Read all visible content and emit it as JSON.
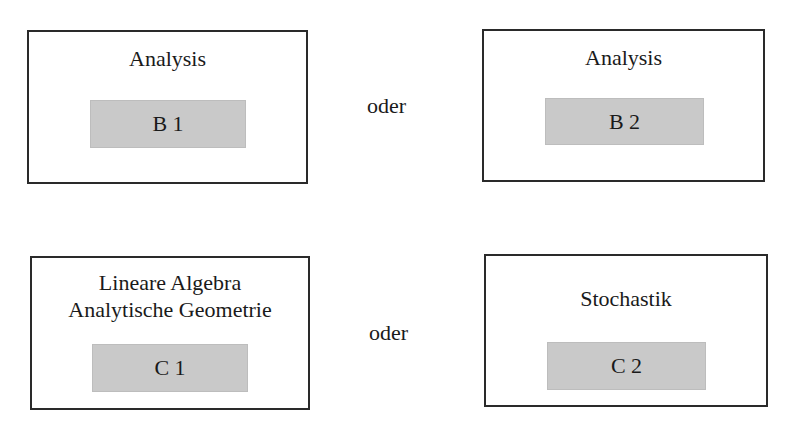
{
  "diagram": {
    "rows": [
      {
        "connector": "oder",
        "options": [
          {
            "title_lines": [
              "Analysis"
            ],
            "code": "B 1"
          },
          {
            "title_lines": [
              "Analysis"
            ],
            "code": "B 2"
          }
        ]
      },
      {
        "connector": "oder",
        "options": [
          {
            "title_lines": [
              "Lineare Algebra",
              "Analytische Geometrie"
            ],
            "code": "C 1"
          },
          {
            "title_lines": [
              "Stochastik"
            ],
            "code": "C 2"
          }
        ]
      }
    ]
  },
  "colors": {
    "border": "#2a2a2a",
    "code_fill": "#c9c9c9",
    "text": "#1a1a1a",
    "background": "#ffffff"
  }
}
